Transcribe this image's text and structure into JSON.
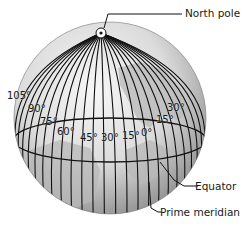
{
  "diagram": {
    "callouts": {
      "north_pole": "North pole",
      "equator": "Equator",
      "prime_meridian": "Prime meridian"
    },
    "meridian_labels": [
      {
        "text": "105°",
        "x": 7,
        "y": 91
      },
      {
        "text": "90°",
        "x": 28,
        "y": 104
      },
      {
        "text": "75°",
        "x": 40,
        "y": 117
      },
      {
        "text": "60°",
        "x": 57,
        "y": 127
      },
      {
        "text": "45°",
        "x": 80,
        "y": 133
      },
      {
        "text": "30°",
        "x": 101,
        "y": 133
      },
      {
        "text": "15°",
        "x": 122,
        "y": 131
      },
      {
        "text": "0°",
        "x": 141,
        "y": 128
      },
      {
        "text": "15°",
        "x": 156,
        "y": 115
      },
      {
        "text": "30°",
        "x": 167,
        "y": 103
      }
    ],
    "colors": {
      "globe_light": "#f2f2f2",
      "globe_dark": "#9c9c9c",
      "land": "#bdbdbd",
      "lines": "#111111"
    }
  }
}
